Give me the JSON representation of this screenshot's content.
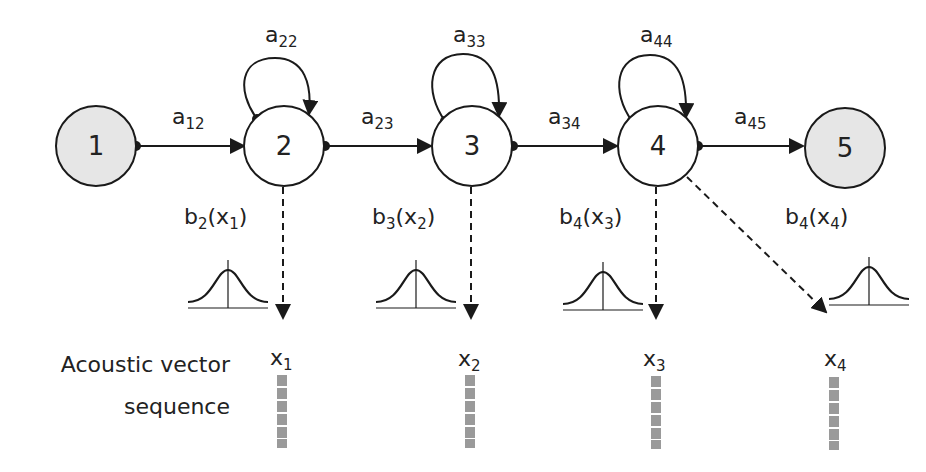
{
  "diagram": {
    "colors": {
      "line": "#1a1a1a",
      "terminal_fill": "#e6e6e6",
      "state_fill": "#ffffff",
      "vector_cell": "#9a9a9a"
    },
    "states": [
      {
        "id": "1",
        "label": "1",
        "type": "entry"
      },
      {
        "id": "2",
        "label": "2",
        "type": "emitting"
      },
      {
        "id": "3",
        "label": "3",
        "type": "emitting"
      },
      {
        "id": "4",
        "label": "4",
        "type": "emitting"
      },
      {
        "id": "5",
        "label": "5",
        "type": "exit"
      }
    ],
    "transitions": [
      {
        "from": "1",
        "to": "2",
        "label": "a",
        "sub": "12"
      },
      {
        "from": "2",
        "to": "2",
        "label": "a",
        "sub": "22"
      },
      {
        "from": "2",
        "to": "3",
        "label": "a",
        "sub": "23"
      },
      {
        "from": "3",
        "to": "3",
        "label": "a",
        "sub": "33"
      },
      {
        "from": "3",
        "to": "4",
        "label": "a",
        "sub": "34"
      },
      {
        "from": "4",
        "to": "4",
        "label": "a",
        "sub": "44"
      },
      {
        "from": "4",
        "to": "5",
        "label": "a",
        "sub": "45"
      }
    ],
    "emissions": [
      {
        "state": "2",
        "label": "b",
        "state_sub": "2",
        "obs": "x",
        "obs_sub": "1"
      },
      {
        "state": "3",
        "label": "b",
        "state_sub": "3",
        "obs": "x",
        "obs_sub": "2"
      },
      {
        "state": "4",
        "label": "b",
        "state_sub": "4",
        "obs": "x",
        "obs_sub": "3"
      },
      {
        "state": "4",
        "label": "b",
        "state_sub": "4",
        "obs": "x",
        "obs_sub": "4"
      }
    ],
    "observations": [
      {
        "label": "x",
        "sub": "1"
      },
      {
        "label": "x",
        "sub": "2"
      },
      {
        "label": "x",
        "sub": "3"
      },
      {
        "label": "x",
        "sub": "4"
      }
    ],
    "side_label": {
      "line1": "Acoustic vector",
      "line2": "sequence"
    },
    "vector_cells_per_observation": 6
  }
}
